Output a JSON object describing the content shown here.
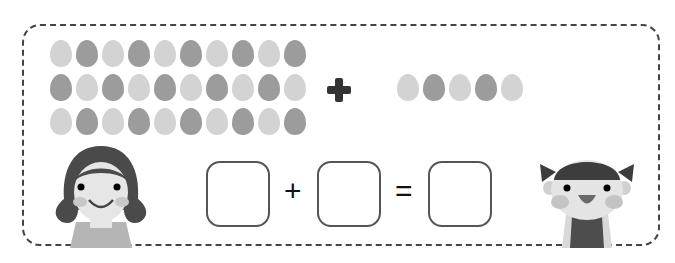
{
  "worksheet": {
    "group_a": {
      "rows": 3,
      "per_row": 10,
      "total": 30,
      "rows_pattern": [
        [
          "l",
          "d",
          "l",
          "d",
          "l",
          "d",
          "l",
          "d",
          "l",
          "d"
        ],
        [
          "d",
          "l",
          "d",
          "l",
          "d",
          "l",
          "d",
          "l",
          "d",
          "l"
        ],
        [
          "l",
          "d",
          "l",
          "d",
          "l",
          "d",
          "l",
          "d",
          "l",
          "d"
        ]
      ]
    },
    "operator_big": "+",
    "group_b": {
      "count": 5,
      "pattern": [
        "l",
        "d",
        "l",
        "d",
        "l"
      ]
    },
    "equation": {
      "plus": "+",
      "equals": "=",
      "boxes": [
        "",
        "",
        ""
      ]
    },
    "characters": [
      "girl-left",
      "child-right"
    ],
    "colors": {
      "egg_light": "#d3d3d3",
      "egg_dark": "#9c9c9c",
      "border": "#444444"
    }
  }
}
